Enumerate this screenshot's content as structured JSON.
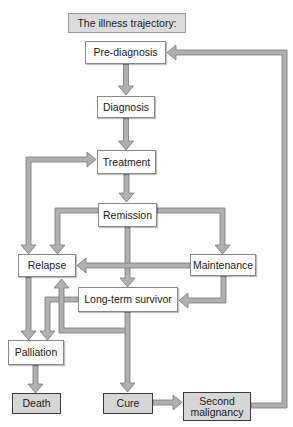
{
  "title": "The illness trajectory:",
  "nodes": {
    "pre_diagnosis": "Pre-diagnosis",
    "diagnosis": "Diagnosis",
    "treatment": "Treatment",
    "remission": "Remission",
    "relapse": "Relapse",
    "maintenance": "Maintenance",
    "long_term_survivor": "Long-term survivor",
    "palliation": "Palliation",
    "death": "Death",
    "cure": "Cure",
    "second_malignancy_line1": "Second",
    "second_malignancy_line2": "malignancy"
  },
  "edges": [
    {
      "from": "Pre-diagnosis",
      "to": "Diagnosis"
    },
    {
      "from": "Diagnosis",
      "to": "Treatment"
    },
    {
      "from": "Treatment",
      "to": "Remission"
    },
    {
      "from": "Relapse",
      "to": "Treatment"
    },
    {
      "from": "Remission",
      "to": "Relapse"
    },
    {
      "from": "Remission",
      "to": "Maintenance"
    },
    {
      "from": "Remission",
      "to": "Long-term survivor"
    },
    {
      "from": "Maintenance",
      "to": "Relapse"
    },
    {
      "from": "Maintenance",
      "to": "Long-term survivor"
    },
    {
      "from": "Relapse",
      "to": "Palliation"
    },
    {
      "from": "Long-term survivor",
      "to": "Palliation"
    },
    {
      "from": "Long-term survivor",
      "to": "Relapse"
    },
    {
      "from": "Long-term survivor",
      "to": "Cure"
    },
    {
      "from": "Palliation",
      "to": "Death"
    },
    {
      "from": "Cure",
      "to": "Second malignancy"
    },
    {
      "from": "Second malignancy",
      "to": "Pre-diagnosis"
    }
  ],
  "colors": {
    "connector": "#a8a8a8",
    "connector_edge": "#7a7a7a",
    "terminal_fill": "#d6d6d6",
    "title_fill": "#dcdcdc"
  }
}
